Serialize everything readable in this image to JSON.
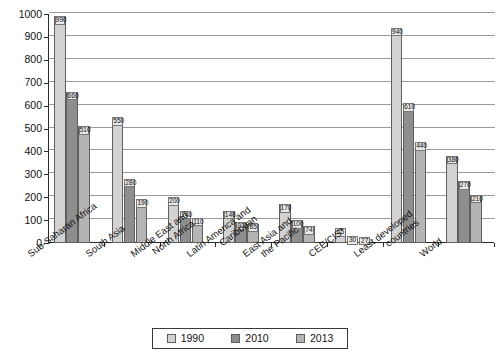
{
  "chart_data": {
    "type": "bar",
    "title": "",
    "xlabel": "",
    "ylabel": "",
    "ylim": [
      0,
      1000
    ],
    "ytick_step": 100,
    "yticks": [
      0,
      100,
      200,
      300,
      400,
      500,
      600,
      700,
      800,
      900,
      1000
    ],
    "grid": true,
    "legend_position": "bottom",
    "categories": [
      "Sub-Saharan Africa",
      "South Asia",
      "Middle East and\nNorth Africa",
      "Latin America and\nCaribbean",
      "East Asia and\nthe Pacific",
      "CEE/CIS*",
      "Least developed\ncountries",
      "World"
    ],
    "category_lines": [
      [
        "Sub-Saharan Africa"
      ],
      [
        "South Asia"
      ],
      [
        "Middle East and",
        "North Africa"
      ],
      [
        "Latin America and",
        "Caribbean"
      ],
      [
        "East Asia and",
        "the Pacific"
      ],
      [
        "CEE/CIS*"
      ],
      [
        "Least developed",
        "countries"
      ],
      [
        "World"
      ]
    ],
    "series": [
      {
        "name": "1990",
        "color": "#d2d2d2",
        "values": [
          990,
          550,
          200,
          140,
          170,
          65,
          940,
          380
        ]
      },
      {
        "name": "2010",
        "color": "#8e8e8e",
        "values": [
          660,
          280,
          140,
          93,
          100,
          30,
          610,
          270
        ]
      },
      {
        "name": "2013",
        "color": "#b4b4b4",
        "values": [
          510,
          190,
          110,
          85,
          74,
          27,
          440,
          210
        ]
      }
    ]
  },
  "legend": {
    "items": [
      {
        "label": "1990",
        "color": "#d2d2d2"
      },
      {
        "label": "2010",
        "color": "#8e8e8e"
      },
      {
        "label": "2013",
        "color": "#b4b4b4"
      }
    ]
  },
  "axis": {
    "y_tick_labels": [
      "1000",
      "900",
      "800",
      "700",
      "600",
      "500",
      "400",
      "300",
      "200",
      "100",
      "0"
    ]
  }
}
